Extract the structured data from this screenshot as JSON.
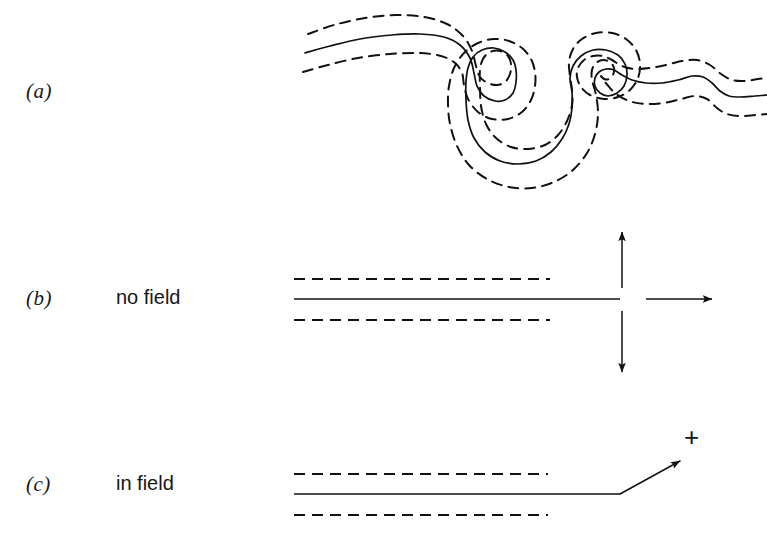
{
  "figure": {
    "background_color": "#ffffff",
    "line_color": "#111111",
    "width": 767,
    "height": 549
  },
  "panels": [
    {
      "tag": "(a)",
      "caption": "",
      "description": "coiled chain inside dashed tube"
    },
    {
      "tag": "(b)",
      "caption": "no field",
      "description": "straight chain in tube with free end fluctuating in all directions"
    },
    {
      "tag": "(c)",
      "caption": "in field",
      "description": "straight chain in tube with charged end pulled by field"
    }
  ],
  "annotations": {
    "charge_label": "+"
  },
  "chart_data": {
    "type": "line",
    "xlabel": "",
    "ylabel": "",
    "xlim": [
      0,
      767
    ],
    "ylim": [
      549,
      0
    ],
    "grid": false,
    "legend": null,
    "series": [
      {
        "name": "panel-a-chain-contour",
        "panel": "(a)",
        "style": "solid",
        "points": [
          [
            305,
            53
          ],
          [
            330,
            46
          ],
          [
            360,
            39
          ],
          [
            392,
            35
          ],
          [
            420,
            34
          ],
          [
            444,
            37
          ],
          [
            460,
            45
          ],
          [
            470,
            58
          ],
          [
            474,
            73
          ],
          [
            477,
            86
          ],
          [
            484,
            96
          ],
          [
            495,
            101
          ],
          [
            505,
            100
          ],
          [
            513,
            93
          ],
          [
            516,
            82
          ],
          [
            516,
            70
          ],
          [
            513,
            60
          ],
          [
            505,
            52
          ],
          [
            494,
            48
          ],
          [
            482,
            50
          ],
          [
            473,
            57
          ],
          [
            468,
            68
          ],
          [
            466,
            82
          ],
          [
            466,
            100
          ],
          [
            468,
            120
          ],
          [
            474,
            138
          ],
          [
            485,
            152
          ],
          [
            500,
            161
          ],
          [
            518,
            164
          ],
          [
            536,
            161
          ],
          [
            551,
            152
          ],
          [
            562,
            139
          ],
          [
            569,
            124
          ],
          [
            572,
            108
          ],
          [
            572,
            92
          ],
          [
            570,
            78
          ],
          [
            573,
            66
          ],
          [
            581,
            56
          ],
          [
            593,
            50
          ],
          [
            606,
            50
          ],
          [
            618,
            55
          ],
          [
            625,
            64
          ],
          [
            627,
            75
          ],
          [
            624,
            86
          ],
          [
            617,
            93
          ],
          [
            608,
            96
          ],
          [
            600,
            93
          ],
          [
            595,
            86
          ],
          [
            595,
            78
          ],
          [
            599,
            72
          ],
          [
            606,
            69
          ],
          [
            614,
            70
          ],
          [
            622,
            75
          ],
          [
            632,
            80
          ],
          [
            646,
            83
          ],
          [
            662,
            83
          ],
          [
            678,
            80
          ],
          [
            692,
            76
          ],
          [
            703,
            77
          ],
          [
            712,
            83
          ],
          [
            720,
            91
          ],
          [
            729,
            96
          ],
          [
            740,
            97
          ],
          [
            755,
            96
          ],
          [
            767,
            95
          ]
        ]
      },
      {
        "name": "panel-a-tube-upper",
        "panel": "(a)",
        "style": "dashed",
        "points": [
          [
            308,
            34
          ],
          [
            334,
            25
          ],
          [
            365,
            18
          ],
          [
            396,
            15
          ],
          [
            424,
            17
          ],
          [
            447,
            24
          ],
          [
            463,
            36
          ],
          [
            472,
            51
          ],
          [
            476,
            66
          ],
          [
            480,
            77
          ],
          [
            488,
            83
          ],
          [
            497,
            85
          ],
          [
            505,
            82
          ],
          [
            510,
            74
          ],
          [
            511,
            64
          ],
          [
            508,
            56
          ],
          [
            500,
            51
          ],
          [
            490,
            52
          ],
          [
            483,
            59
          ],
          [
            480,
            70
          ],
          [
            480,
            86
          ],
          [
            481,
            106
          ],
          [
            486,
            124
          ],
          [
            496,
            138
          ],
          [
            511,
            147
          ],
          [
            528,
            149
          ],
          [
            545,
            145
          ],
          [
            558,
            135
          ],
          [
            567,
            121
          ],
          [
            572,
            105
          ],
          [
            572,
            90
          ],
          [
            570,
            76
          ],
          [
            569,
            62
          ],
          [
            573,
            49
          ],
          [
            582,
            39
          ],
          [
            596,
            33
          ],
          [
            612,
            33
          ],
          [
            626,
            39
          ],
          [
            636,
            50
          ],
          [
            640,
            64
          ],
          [
            638,
            78
          ],
          [
            630,
            90
          ],
          [
            618,
            97
          ],
          [
            604,
            99
          ],
          [
            590,
            95
          ],
          [
            581,
            87
          ],
          [
            577,
            77
          ],
          [
            578,
            68
          ],
          [
            584,
            60
          ],
          [
            593,
            56
          ],
          [
            603,
            56
          ],
          [
            612,
            60
          ],
          [
            622,
            66
          ],
          [
            634,
            69
          ],
          [
            650,
            68
          ],
          [
            666,
            65
          ],
          [
            682,
            61
          ],
          [
            697,
            60
          ],
          [
            710,
            65
          ],
          [
            721,
            74
          ],
          [
            732,
            80
          ],
          [
            745,
            81
          ],
          [
            758,
            79
          ],
          [
            767,
            78
          ]
        ]
      },
      {
        "name": "panel-a-tube-lower",
        "panel": "(a)",
        "style": "dashed",
        "points": [
          [
            303,
            72
          ],
          [
            328,
            65
          ],
          [
            358,
            58
          ],
          [
            390,
            54
          ],
          [
            419,
            53
          ],
          [
            441,
            56
          ],
          [
            455,
            63
          ],
          [
            462,
            73
          ],
          [
            464,
            85
          ],
          [
            468,
            99
          ],
          [
            478,
            112
          ],
          [
            492,
            119
          ],
          [
            508,
            119
          ],
          [
            522,
            112
          ],
          [
            531,
            100
          ],
          [
            535,
            86
          ],
          [
            535,
            72
          ],
          [
            531,
            59
          ],
          [
            522,
            48
          ],
          [
            509,
            41
          ],
          [
            494,
            39
          ],
          [
            478,
            43
          ],
          [
            464,
            53
          ],
          [
            454,
            68
          ],
          [
            449,
            86
          ],
          [
            448,
            104
          ],
          [
            450,
            124
          ],
          [
            457,
            146
          ],
          [
            469,
            165
          ],
          [
            487,
            179
          ],
          [
            509,
            187
          ],
          [
            532,
            188
          ],
          [
            554,
            182
          ],
          [
            573,
            170
          ],
          [
            587,
            153
          ],
          [
            595,
            134
          ],
          [
            598,
            114
          ],
          [
            596,
            95
          ],
          [
            592,
            80
          ],
          [
            592,
            70
          ],
          [
            596,
            63
          ],
          [
            603,
            60
          ],
          [
            610,
            62
          ],
          [
            614,
            68
          ],
          [
            613,
            75
          ],
          [
            609,
            79
          ],
          [
            604,
            79
          ],
          [
            601,
            76
          ],
          [
            605,
            82
          ],
          [
            615,
            93
          ],
          [
            629,
            101
          ],
          [
            646,
            104
          ],
          [
            664,
            103
          ],
          [
            681,
            99
          ],
          [
            695,
            96
          ],
          [
            707,
            99
          ],
          [
            717,
            108
          ],
          [
            727,
            114
          ],
          [
            740,
            116
          ],
          [
            755,
            115
          ],
          [
            767,
            114
          ]
        ]
      },
      {
        "name": "panel-b-chain",
        "panel": "(b)",
        "style": "solid",
        "points": [
          [
            294,
            299
          ],
          [
            620,
            299
          ]
        ]
      },
      {
        "name": "panel-b-tube-upper",
        "panel": "(b)",
        "style": "dashed",
        "points": [
          [
            294,
            279
          ],
          [
            550,
            279
          ]
        ]
      },
      {
        "name": "panel-b-tube-lower",
        "panel": "(b)",
        "style": "dashed",
        "points": [
          [
            294,
            320
          ],
          [
            550,
            320
          ]
        ]
      },
      {
        "name": "panel-b-arrow-up",
        "panel": "(b)",
        "style": "arrow",
        "points": [
          [
            622,
            288
          ],
          [
            622,
            232
          ]
        ]
      },
      {
        "name": "panel-b-arrow-down",
        "panel": "(b)",
        "style": "arrow",
        "points": [
          [
            622,
            311
          ],
          [
            622,
            372
          ]
        ]
      },
      {
        "name": "panel-b-arrow-right",
        "panel": "(b)",
        "style": "arrow",
        "points": [
          [
            646,
            299
          ],
          [
            712,
            299
          ]
        ]
      },
      {
        "name": "panel-c-chain",
        "panel": "(c)",
        "style": "solid",
        "points": [
          [
            294,
            494
          ],
          [
            620,
            494
          ]
        ]
      },
      {
        "name": "panel-c-tube-upper",
        "panel": "(c)",
        "style": "dashed",
        "points": [
          [
            294,
            474
          ],
          [
            548,
            474
          ]
        ]
      },
      {
        "name": "panel-c-tube-lower",
        "panel": "(c)",
        "style": "dashed",
        "points": [
          [
            294,
            515
          ],
          [
            548,
            515
          ]
        ]
      },
      {
        "name": "panel-c-arrow-tilted",
        "panel": "(c)",
        "style": "arrow",
        "points": [
          [
            620,
            494
          ],
          [
            680,
            461
          ]
        ]
      }
    ]
  }
}
